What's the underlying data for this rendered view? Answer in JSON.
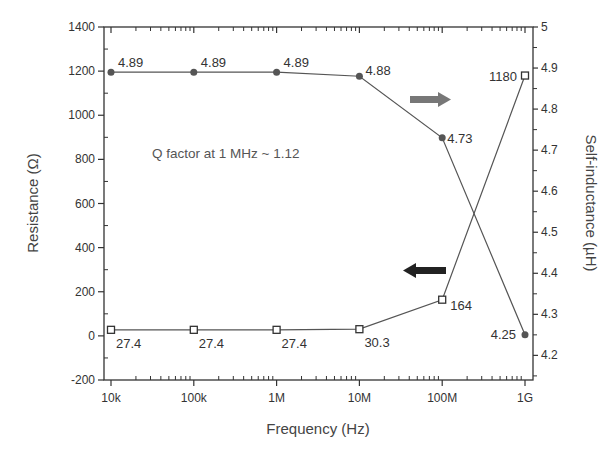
{
  "chart_data": {
    "type": "line",
    "title": "",
    "xlabel": "Frequency (Hz)",
    "ylabel": "Resistance (Ω)",
    "y2label": "Self-inductance (µH)",
    "xscale": "log",
    "x": [
      10000,
      100000,
      1000000,
      10000000,
      100000000,
      1000000000
    ],
    "x_tick_labels": [
      "10k",
      "100k",
      "1M",
      "10M",
      "100M",
      "1G"
    ],
    "xlim": [
      10000,
      1000000000
    ],
    "ylim": [
      -200,
      1400
    ],
    "y_ticks": [
      -200,
      0,
      200,
      400,
      600,
      800,
      1000,
      1200,
      1400
    ],
    "y2lim": [
      4.14,
      5.0
    ],
    "y2_ticks": [
      4.2,
      4.3,
      4.4,
      4.5,
      4.6,
      4.7,
      4.8,
      4.9,
      5
    ],
    "grid": false,
    "series": [
      {
        "name": "Resistance",
        "axis": "left",
        "marker": "open-square",
        "values": [
          27.4,
          27.4,
          27.4,
          30.3,
          164,
          1180
        ],
        "labels": [
          "27.4",
          "27.4",
          "27.4",
          "30.3",
          "164",
          "1180"
        ]
      },
      {
        "name": "Self-inductance",
        "axis": "right",
        "marker": "filled-circle",
        "values": [
          4.89,
          4.89,
          4.89,
          4.88,
          4.73,
          4.25
        ],
        "labels": [
          "4.89",
          "4.89",
          "4.89",
          "4.88",
          "4.73",
          "4.25"
        ]
      }
    ],
    "annotations": [
      {
        "text": "Q factor at 1 MHz  ~ 1.12"
      },
      {
        "type": "arrow",
        "direction": "right",
        "meaning": "inductance series uses right axis",
        "color": "#777777"
      },
      {
        "type": "arrow",
        "direction": "left",
        "meaning": "resistance series uses left axis",
        "color": "#222222"
      }
    ],
    "colors": {
      "axis": "#333333",
      "line": "#555555",
      "marker": "#555555"
    }
  }
}
